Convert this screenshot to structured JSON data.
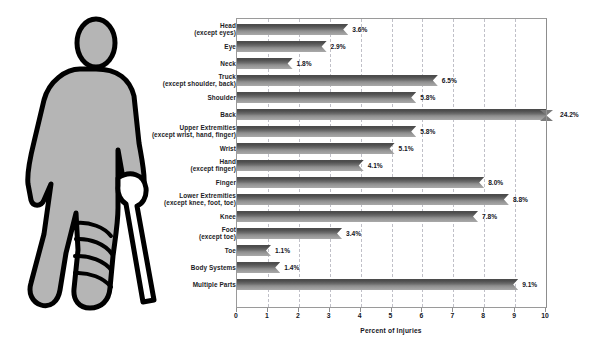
{
  "chart_data": {
    "type": "bar",
    "orientation": "horizontal",
    "title": "",
    "xlabel": "Percent of Injuries",
    "ylabel": "",
    "xlim": [
      0,
      10
    ],
    "xticks": [
      0,
      1,
      2,
      3,
      4,
      5,
      6,
      7,
      8,
      9,
      10
    ],
    "xtick_labels": [
      "0",
      "1",
      "2",
      "3",
      "4",
      "5",
      "6",
      "7",
      "8",
      "9",
      "10"
    ],
    "grid": "vertical-dashed",
    "legend": null,
    "value_suffix": "%",
    "categories": [
      "Head (except eyes)",
      "Eye",
      "Neck",
      "Truck (except shoulder, back)",
      "Shoulder",
      "Back",
      "Upper Extremities (except wrist, hand, finger)",
      "Wrist",
      "Hand (except finger)",
      "Finger",
      "Lower Extremities (except knee, foot, toe)",
      "Knee",
      "Foot (except toe)",
      "Toe",
      "Body Systems",
      "Multiple Parts"
    ],
    "values": [
      3.6,
      2.9,
      1.8,
      6.5,
      5.8,
      24.2,
      5.8,
      5.1,
      4.1,
      8.0,
      8.8,
      7.8,
      3.4,
      1.1,
      1.4,
      9.1
    ],
    "value_labels": [
      "3.6%",
      "2.9%",
      "1.8%",
      "6.5%",
      "5.8%",
      "24.2%",
      "5.8%",
      "5.1%",
      "4.1%",
      "8.0%",
      "8.8%",
      "7.8%",
      "3.4%",
      "1.1%",
      "1.4%",
      "9.1%"
    ],
    "axis_break": {
      "category": "Back",
      "value": 24.2,
      "note": "bar exceeds axis maximum; drawn to axis edge with break marker"
    },
    "colors": {
      "bar_top": "#4a4a4a",
      "bar_bottom": "#a9a9a9",
      "gridline": "#c0c0c8",
      "frame": "#9a9a9a",
      "text": "#15151d",
      "background": "#ffffff",
      "figure_fill": "#b5b5b5",
      "figure_outline": "#000000"
    }
  },
  "rows": [
    {
      "label_line1": "Head",
      "label_line2": "(except eyes)",
      "value": 3.6,
      "value_label": "3.6%"
    },
    {
      "label_line1": "Eye",
      "label_line2": "",
      "value": 2.9,
      "value_label": "2.9%"
    },
    {
      "label_line1": "Neck",
      "label_line2": "",
      "value": 1.8,
      "value_label": "1.8%"
    },
    {
      "label_line1": "Truck",
      "label_line2": "(except shoulder, back)",
      "value": 6.5,
      "value_label": "6.5%"
    },
    {
      "label_line1": "Shoulder",
      "label_line2": "",
      "value": 5.8,
      "value_label": "5.8%"
    },
    {
      "label_line1": "Back",
      "label_line2": "",
      "value": 24.2,
      "value_label": "24.2%"
    },
    {
      "label_line1": "Upper Extremities",
      "label_line2": "(except wrist, hand, finger)",
      "value": 5.8,
      "value_label": "5.8%"
    },
    {
      "label_line1": "Wrist",
      "label_line2": "",
      "value": 5.1,
      "value_label": "5.1%"
    },
    {
      "label_line1": "Hand",
      "label_line2": "(except finger)",
      "value": 4.1,
      "value_label": "4.1%"
    },
    {
      "label_line1": "Finger",
      "label_line2": "",
      "value": 8.0,
      "value_label": "8.0%"
    },
    {
      "label_line1": "Lower Extremities",
      "label_line2": "(except knee, foot, toe)",
      "value": 8.8,
      "value_label": "8.8%"
    },
    {
      "label_line1": "Knee",
      "label_line2": "",
      "value": 7.8,
      "value_label": "7.8%"
    },
    {
      "label_line1": "Foot",
      "label_line2": "(except toe)",
      "value": 3.4,
      "value_label": "3.4%"
    },
    {
      "label_line1": "Toe",
      "label_line2": "",
      "value": 1.1,
      "value_label": "1.1%"
    },
    {
      "label_line1": "Body Systems",
      "label_line2": "",
      "value": 1.4,
      "value_label": "1.4%"
    },
    {
      "label_line1": "Multiple Parts",
      "label_line2": "",
      "value": 9.1,
      "value_label": "9.1%"
    }
  ],
  "illustration": {
    "name": "injured-person-with-cane",
    "description": "Cartoon silhouette of a person with a bandaged leg holding a cane"
  }
}
